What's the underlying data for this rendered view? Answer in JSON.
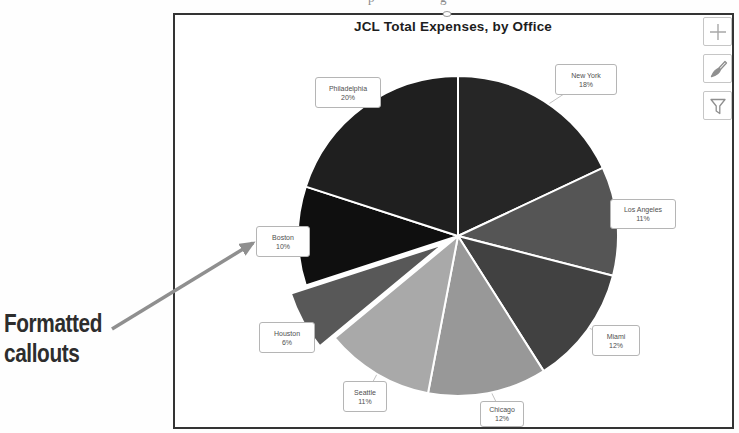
{
  "page": {
    "annotation": {
      "line1": "Formatted",
      "line2": "callouts"
    },
    "artifacts": {
      "letters": [
        "p",
        "g"
      ]
    }
  },
  "chart_buttons": [
    {
      "icon": "plus-icon"
    },
    {
      "icon": "brush-icon"
    },
    {
      "icon": "funnel-icon"
    }
  ],
  "chart_data": {
    "type": "pie",
    "title": "JCL Total Expenses, by Office",
    "direction": "clockwise",
    "start_angle_deg": 0,
    "legend": "none",
    "label_style": "formatted rectangular callouts with leader lines",
    "pie_geometry": {
      "cx": 458,
      "cy": 236,
      "r": 160,
      "explode_offset": 17
    },
    "annotation_arrow": {
      "x1": 112,
      "y1": 329,
      "x2": 253,
      "y2": 243,
      "color": "#8f8f8f"
    },
    "slices": [
      {
        "label": "New York",
        "pct_label": "18%",
        "value_pct": 18,
        "color": "#262626",
        "exploded": false,
        "callout": {
          "x": 555,
          "y": 64,
          "w": 62,
          "h": 31
        }
      },
      {
        "label": "Los Angeles",
        "pct_label": "11%",
        "value_pct": 11,
        "color": "#555555",
        "exploded": false,
        "callout": {
          "x": 610,
          "y": 199,
          "w": 66,
          "h": 30
        }
      },
      {
        "label": "Miami",
        "pct_label": "12%",
        "value_pct": 12,
        "color": "#414141",
        "exploded": false,
        "callout": {
          "x": 592,
          "y": 325,
          "w": 48,
          "h": 31
        }
      },
      {
        "label": "Chicago",
        "pct_label": "12%",
        "value_pct": 12,
        "color": "#989898",
        "exploded": false,
        "callout": {
          "x": 480,
          "y": 401,
          "w": 44,
          "h": 26
        }
      },
      {
        "label": "Seattle",
        "pct_label": "11%",
        "value_pct": 11,
        "color": "#a9a9a9",
        "exploded": false,
        "callout": {
          "x": 343,
          "y": 381,
          "w": 44,
          "h": 31
        }
      },
      {
        "label": "Houston",
        "pct_label": "6%",
        "value_pct": 6,
        "color": "#585858",
        "exploded": true,
        "callout": {
          "x": 259,
          "y": 322,
          "w": 56,
          "h": 31
        }
      },
      {
        "label": "Boston",
        "pct_label": "10%",
        "value_pct": 10,
        "color": "#0f0f0f",
        "exploded": false,
        "callout": {
          "x": 256,
          "y": 226,
          "w": 54,
          "h": 31
        }
      },
      {
        "label": "Philadelphia",
        "pct_label": "20%",
        "value_pct": 20,
        "color": "#1f1f1f",
        "exploded": false,
        "callout": {
          "x": 315,
          "y": 77,
          "w": 66,
          "h": 31
        }
      }
    ]
  }
}
